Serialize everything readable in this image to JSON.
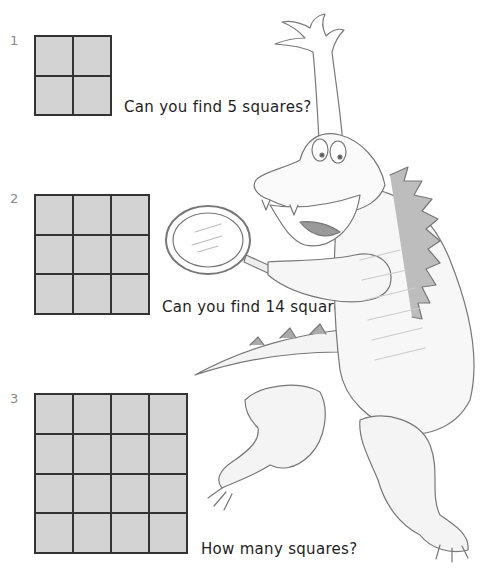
{
  "puzzles": [
    {
      "number": "1",
      "rows": 2,
      "cols": 2,
      "question": "Can you find 5 squares?"
    },
    {
      "number": "2",
      "rows": 3,
      "cols": 3,
      "question": "Can you find 14 squares?"
    },
    {
      "number": "3",
      "rows": 4,
      "cols": 4,
      "question": "How many squares?"
    }
  ],
  "illustration": {
    "subject": "alligator-with-magnifying-glass"
  },
  "colors": {
    "grid_fill": "#d3d3d3",
    "grid_line": "#333333",
    "number_label": "#888888",
    "text": "#1e1e1e"
  }
}
